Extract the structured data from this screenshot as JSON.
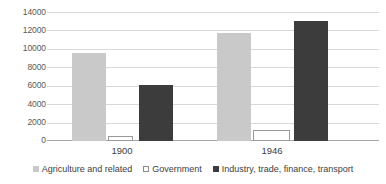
{
  "chart_data": {
    "type": "bar",
    "title": "",
    "subtitle": "",
    "xlabel": "",
    "ylabel": "",
    "categories": [
      "1900",
      "1946"
    ],
    "series": [
      {
        "name": "Agriculture and related",
        "values": [
          9630,
          11800
        ],
        "color": "#c9c9c9",
        "marker": "filled-square-light"
      },
      {
        "name": "Government",
        "values": [
          600,
          1180
        ],
        "color": "#ffffff",
        "marker": "hollow-square"
      },
      {
        "name": "Industry, trade, finance, transport",
        "values": [
          6180,
          13100
        ],
        "color": "#3c3c3c",
        "marker": "filled-square-dark"
      }
    ],
    "ylim": [
      0,
      14000
    ],
    "ytick_step": 2000,
    "ytick_labels": [
      "0",
      "2000",
      "4000",
      "6000",
      "8000",
      "10000",
      "12000",
      "14000"
    ],
    "grid": true,
    "grid_axis": "y",
    "legend_position": "bottom",
    "bar_grouping": "clustered"
  },
  "colors": {
    "series_1": "#c9c9c9",
    "series_2": "#ffffff",
    "series_3": "#3c3c3c",
    "gridline": "#d9d9d9",
    "axis": "#a6a6a6",
    "text": "#404040",
    "background": "#ffffff"
  }
}
